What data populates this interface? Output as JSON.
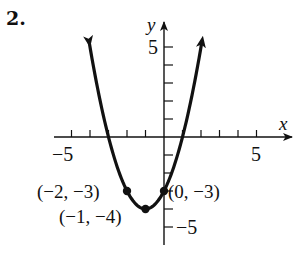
{
  "problem": {
    "number": "2."
  },
  "axes": {
    "x_label": "x",
    "y_label": "y",
    "x_tick_labels": [
      {
        "value": -5,
        "text": "−5"
      },
      {
        "value": 5,
        "text": "5"
      }
    ],
    "y_tick_labels": [
      {
        "value": 5,
        "text": "5"
      },
      {
        "value": -5,
        "text": "−5"
      }
    ]
  },
  "points": [
    {
      "label": "(−2, −3)",
      "x": -2,
      "y": -3
    },
    {
      "label": "(−1, −4)",
      "x": -1,
      "y": -4
    },
    {
      "label": "(0, −3)",
      "x": 0,
      "y": -3
    }
  ],
  "colors": {
    "ink": "#111111",
    "background": "#ffffff"
  },
  "chart_data": {
    "type": "line",
    "title": "",
    "equation": "y = (x + 1)^2 - 4",
    "xlabel": "x",
    "ylabel": "y",
    "xlim": [
      -6,
      7
    ],
    "ylim": [
      -6,
      6
    ],
    "x_ticks": [
      -5,
      -4,
      -3,
      -2,
      -1,
      0,
      1,
      2,
      3,
      4,
      5
    ],
    "y_ticks": [
      -5,
      -4,
      -3,
      -2,
      -1,
      0,
      1,
      2,
      3,
      4,
      5
    ],
    "x_tick_labels_shown": [
      "-5",
      "5"
    ],
    "y_tick_labels_shown": [
      "5",
      "-5"
    ],
    "grid": false,
    "legend": null,
    "series": [
      {
        "name": "parabola",
        "x": [
          -4.3,
          -4,
          -3,
          -2,
          -1,
          0,
          1,
          2,
          2.3
        ],
        "y": [
          6.89,
          5,
          0,
          -3,
          -4,
          -3,
          0,
          5,
          6.89
        ],
        "arrows_at_ends": true
      }
    ],
    "marked_points": [
      {
        "x": -2,
        "y": -3,
        "label": "(-2, -3)"
      },
      {
        "x": -1,
        "y": -4,
        "label": "(-1, -4)",
        "role": "vertex"
      },
      {
        "x": 0,
        "y": -3,
        "label": "(0, -3)",
        "role": "y-intercept"
      }
    ],
    "x_intercepts": [
      -3,
      1
    ]
  }
}
